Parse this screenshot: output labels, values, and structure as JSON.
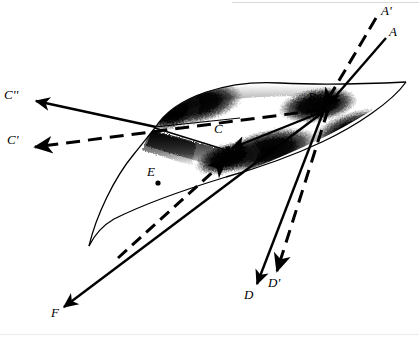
{
  "figure": {
    "type": "geometric-optics-diagram",
    "background_color": "#ffffff",
    "ink_color": "#000000",
    "width": 419,
    "height": 337
  },
  "labels": {
    "a_prime": "A'",
    "a": "A",
    "b": "B",
    "c": "C",
    "c_prime": "C'",
    "c_double_prime": "C''",
    "d": "D",
    "d_prime": "D'",
    "e": "E",
    "f": "F"
  },
  "label_positions": {
    "a_prime": {
      "x": 381,
      "y": 11
    },
    "a": {
      "x": 389,
      "y": 31
    },
    "b": {
      "x": 309,
      "y": 95
    },
    "c": {
      "x": 215,
      "y": 124
    },
    "c_prime": {
      "x": 8,
      "y": 139
    },
    "c_double_prime": {
      "x": 6,
      "y": 94
    },
    "d": {
      "x": 245,
      "y": 293
    },
    "d_prime": {
      "x": 268,
      "y": 281
    },
    "e": {
      "x": 148,
      "y": 169
    },
    "f": {
      "x": 52,
      "y": 311
    }
  },
  "rays": [
    {
      "name": "incident-ray-A-prime",
      "style": "dashed",
      "from": "A'",
      "to": "B",
      "arrow_at": "B"
    },
    {
      "name": "incident-ray-A",
      "style": "solid",
      "from": "A",
      "to": "B",
      "arrow_at": "B"
    },
    {
      "name": "refracted-ray-C-prime",
      "style": "dashed",
      "from": "B",
      "to": "C'",
      "arrow_at": "C'"
    },
    {
      "name": "reflected-ray-C-double-prime",
      "style": "solid",
      "from": "surface",
      "to": "C''",
      "arrow_at": "C''"
    },
    {
      "name": "ray-B-to-C",
      "style": "solid",
      "from": "B",
      "to": "C",
      "arrow_at": "C"
    },
    {
      "name": "transmitted-ray-D",
      "style": "solid",
      "from": "B",
      "to": "D",
      "arrow_at": "D"
    },
    {
      "name": "transmitted-ray-D-prime",
      "style": "dashed",
      "from": "B",
      "to": "D'",
      "arrow_at": "D'"
    },
    {
      "name": "ray-to-E",
      "style": "dashed",
      "from": "F",
      "to": "E",
      "arrow_at": "E"
    },
    {
      "name": "ray-to-F",
      "style": "solid",
      "from": "surface",
      "to": "F",
      "arrow_at": "F"
    }
  ],
  "points": [
    {
      "name": "point-B",
      "x": 322,
      "y": 108
    },
    {
      "name": "point-C",
      "x": 225,
      "y": 148
    },
    {
      "name": "point-E",
      "x": 158,
      "y": 183
    },
    {
      "name": "point-left-node",
      "x": 155,
      "y": 128
    }
  ],
  "surface": {
    "name": "saddle-surface",
    "description": "Airbrushed hyperbolic-paraboloid (saddle) sheet with dark shaded bands",
    "shading": "airbrush-gradient-black",
    "corner_left": {
      "x": 89,
      "y": 246
    },
    "corner_right": {
      "x": 406,
      "y": 82
    }
  }
}
